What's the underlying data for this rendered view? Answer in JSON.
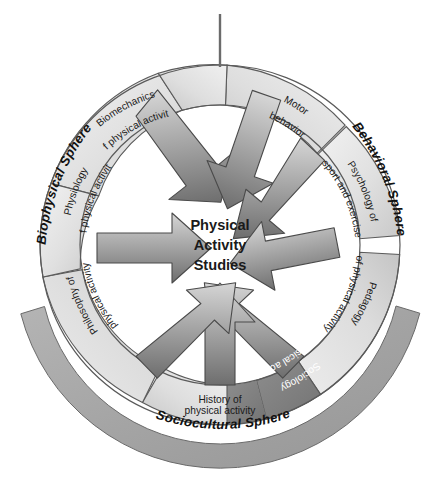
{
  "figure": {
    "center": {
      "line1": "Physical",
      "line2": "Activity",
      "line3": "Studies"
    },
    "spheres": [
      {
        "id": "biophysical",
        "label": "Biophysical Sphere",
        "color": "#d9d9d9",
        "text_color": "#111111"
      },
      {
        "id": "behavioral",
        "label": "Behavioral Sphere",
        "color": "#d9d9d9",
        "text_color": "#111111"
      },
      {
        "id": "sociocultural",
        "label": "Sociocultural Sphere",
        "color": "#a6a6a6",
        "text_color": "#111111"
      }
    ],
    "segments": [
      {
        "id": "biomechanics",
        "sphere": "biophysical",
        "line1": "Biomechanics",
        "line2": "of physical activity",
        "fill": "#e3e3e3",
        "text_color": "#1a1a1a"
      },
      {
        "id": "motor-behavior",
        "sphere": "behavioral",
        "line1": "Motor",
        "line2": "behavior",
        "fill": "#e0e0e0",
        "text_color": "#1a1a1a"
      },
      {
        "id": "psychology",
        "sphere": "behavioral",
        "line1": "Psychology of",
        "line2": "sport and exercise",
        "fill": "#dedede",
        "text_color": "#1a1a1a"
      },
      {
        "id": "pedagogy",
        "sphere": "behavioral",
        "line1": "Pedagogy",
        "line2": "of physical activity",
        "fill": "#e6e6e6",
        "text_color": "#1a1a1a"
      },
      {
        "id": "sociology",
        "sphere": "sociocultural",
        "line1": "Sociology",
        "line2": "of physical activity",
        "fill": "#848484",
        "text_color": "#ffffff"
      },
      {
        "id": "history",
        "sphere": "sociocultural",
        "line1": "History of",
        "line2": "physical activity",
        "fill": "#e2e2e2",
        "text_color": "#1a1a1a"
      },
      {
        "id": "philosophy",
        "sphere": "sociocultural",
        "line1": "Philosophy of",
        "line2": "physical activity",
        "fill": "#dcdcdc",
        "text_color": "#1a1a1a"
      },
      {
        "id": "physiology",
        "sphere": "biophysical",
        "line1": "Physiology",
        "line2": "of physical activity",
        "fill": "#e4e4e4",
        "text_color": "#1a1a1a"
      }
    ],
    "arrows": {
      "count": 8,
      "direction": "inward",
      "tail_color": "#d0d0d0",
      "head_color": "#6e6e6e",
      "outline_color": "#4a4a4a"
    },
    "colors": {
      "ring_outline": "#5a5a5a",
      "background": "#ffffff",
      "top_tick": "#6b6b6b"
    }
  }
}
